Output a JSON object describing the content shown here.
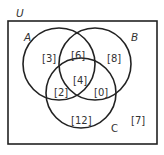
{
  "diagram": {
    "type": "venn-3",
    "universe_label": "U",
    "sets": [
      {
        "name": "A",
        "label": "A"
      },
      {
        "name": "B",
        "label": "B"
      },
      {
        "name": "C",
        "label": "C"
      }
    ],
    "regions": {
      "a_only": "[3]",
      "b_only": "[8]",
      "c_only": "[12]",
      "ab_only": "[6]",
      "ac_only": "[2]",
      "bc_only": "[0]",
      "abc": "[4]",
      "outside": "[7]"
    },
    "colors": {
      "stroke": "#222222",
      "text": "#333333",
      "background": "#ffffff"
    }
  }
}
